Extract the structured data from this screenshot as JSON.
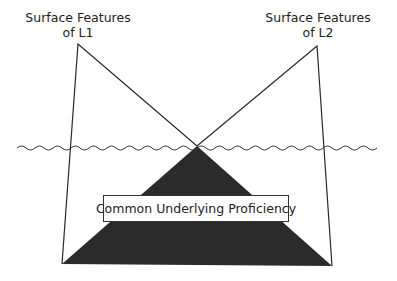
{
  "diagram": {
    "labels": {
      "l1_line1": "Surface Features",
      "l1_line2": "of L1",
      "l2_line1": "Surface Features",
      "l2_line2": "of L2",
      "center": "Common Underlying Proficiency"
    },
    "colors": {
      "line": "#2a2a2a",
      "fill_dark": "#2b2b2b",
      "background": "#ffffff",
      "box_fill": "#ffffff"
    },
    "geometry": {
      "l1_apex": [
        78,
        44
      ],
      "l2_apex": [
        317,
        46
      ],
      "cross_point": [
        197,
        146
      ],
      "base_left": [
        62,
        264
      ],
      "base_right": [
        332,
        266
      ],
      "waterline_y": 148,
      "waterline_x_range": [
        17,
        382
      ]
    }
  }
}
